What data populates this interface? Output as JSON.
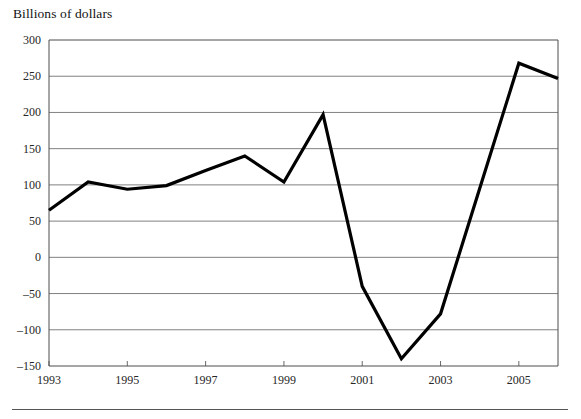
{
  "figure": {
    "axis_title": "Billions of dollars",
    "footer_rule": true
  },
  "chart_data": {
    "type": "line",
    "title": "",
    "subtitle": "",
    "xlabel": "",
    "ylabel": "Billions of dollars",
    "x": [
      1993,
      1994,
      1995,
      1996,
      1997,
      1998,
      1999,
      2000,
      2001,
      2002,
      2003,
      2004,
      2005,
      2006
    ],
    "values": [
      65,
      104,
      94,
      99,
      120,
      140,
      104,
      197,
      -40,
      -140,
      -78,
      95,
      268,
      247
    ],
    "series": [
      {
        "name": "Billions of dollars",
        "color": "#000000",
        "values": [
          65,
          104,
          94,
          99,
          120,
          140,
          104,
          197,
          -40,
          -140,
          -78,
          95,
          268,
          247
        ]
      }
    ],
    "ylim": [
      -150,
      300
    ],
    "yticks": [
      300,
      250,
      200,
      150,
      100,
      50,
      0,
      -50,
      -100,
      -150
    ],
    "ytick_labels": [
      "300",
      "250",
      "200",
      "150",
      "100",
      "50",
      "0",
      "–50",
      "–100",
      "–150"
    ],
    "xlim": [
      1993,
      2006
    ],
    "xticks": [
      1993,
      1995,
      1997,
      1999,
      2001,
      2003,
      2005
    ],
    "xtick_labels": [
      "1993",
      "1995",
      "1997",
      "1999",
      "2001",
      "2003",
      "2005"
    ],
    "grid": "horizontal",
    "legend": "none",
    "annotations": []
  }
}
